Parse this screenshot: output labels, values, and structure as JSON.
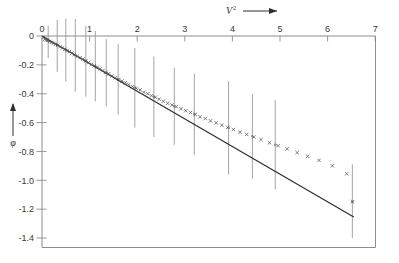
{
  "chart_data": {
    "type": "scatter",
    "title": "",
    "subtitle": "",
    "xlabel": "V²",
    "xlabel_base": "V",
    "xlabel_exponent": "2",
    "ylabel": "φ",
    "xlim": [
      0,
      7
    ],
    "ylim": [
      -1.4,
      0
    ],
    "grid": false,
    "legend": "none",
    "x_ticks": [
      "0",
      "1",
      "2",
      "3",
      "4",
      "5",
      "6",
      "7"
    ],
    "x_tick_values": [
      0,
      1,
      2,
      3,
      4,
      5,
      6,
      7
    ],
    "y_ticks": [
      "0",
      "-0.2",
      "-0.4",
      "-0.6",
      "-0.8",
      "-1.0",
      "-1.2",
      "-1.4"
    ],
    "y_tick_values": [
      0,
      -0.2,
      -0.4,
      -0.6,
      -0.8,
      -1.0,
      -1.2,
      -1.4
    ],
    "origin_label": "0",
    "x_axis_arrow": true,
    "y_axis_arrow": true,
    "marker": "x",
    "marker_color": "#555555",
    "fit_line_color": "#2b2b2b",
    "errorbar_color": "#9a9a9a",
    "frame_color": "#8d8d8d",
    "series": [
      {
        "name": "fit-line",
        "type": "line",
        "x": [
          0.0,
          6.55
        ],
        "y": [
          0.0,
          -1.255
        ]
      },
      {
        "name": "data-points",
        "type": "scatter",
        "points": [
          [
            0.03,
            -0.012
          ],
          [
            0.06,
            -0.022
          ],
          [
            0.09,
            -0.028
          ],
          [
            0.12,
            -0.03
          ],
          [
            0.16,
            -0.038
          ],
          [
            0.2,
            -0.044
          ],
          [
            0.24,
            -0.05
          ],
          [
            0.28,
            -0.058
          ],
          [
            0.33,
            -0.064
          ],
          [
            0.38,
            -0.074
          ],
          [
            0.43,
            -0.082
          ],
          [
            0.48,
            -0.092
          ],
          [
            0.53,
            -0.1
          ],
          [
            0.58,
            -0.108
          ],
          [
            0.63,
            -0.118
          ],
          [
            0.68,
            -0.128
          ],
          [
            0.74,
            -0.14
          ],
          [
            0.8,
            -0.15
          ],
          [
            0.86,
            -0.16
          ],
          [
            0.92,
            -0.172
          ],
          [
            0.98,
            -0.184
          ],
          [
            1.04,
            -0.196
          ],
          [
            1.1,
            -0.206
          ],
          [
            1.16,
            -0.216
          ],
          [
            1.22,
            -0.228
          ],
          [
            1.28,
            -0.24
          ],
          [
            1.34,
            -0.252
          ],
          [
            1.4,
            -0.262
          ],
          [
            1.47,
            -0.276
          ],
          [
            1.54,
            -0.29
          ],
          [
            1.61,
            -0.3
          ],
          [
            1.68,
            -0.312
          ],
          [
            1.75,
            -0.324
          ],
          [
            1.82,
            -0.336
          ],
          [
            1.9,
            -0.35
          ],
          [
            1.98,
            -0.362
          ],
          [
            2.06,
            -0.374
          ],
          [
            2.14,
            -0.39
          ],
          [
            2.22,
            -0.4
          ],
          [
            2.3,
            -0.414
          ],
          [
            2.38,
            -0.424
          ],
          [
            2.46,
            -0.438
          ],
          [
            2.55,
            -0.452
          ],
          [
            2.64,
            -0.466
          ],
          [
            2.73,
            -0.478
          ],
          [
            2.82,
            -0.49
          ],
          [
            2.92,
            -0.504
          ],
          [
            3.02,
            -0.518
          ],
          [
            3.12,
            -0.53
          ],
          [
            3.22,
            -0.544
          ],
          [
            3.32,
            -0.56
          ],
          [
            3.43,
            -0.572
          ],
          [
            3.54,
            -0.588
          ],
          [
            3.66,
            -0.602
          ],
          [
            3.78,
            -0.618
          ],
          [
            3.9,
            -0.634
          ],
          [
            4.02,
            -0.648
          ],
          [
            4.16,
            -0.666
          ],
          [
            4.3,
            -0.682
          ],
          [
            4.45,
            -0.7
          ],
          [
            4.6,
            -0.718
          ],
          [
            4.78,
            -0.74
          ],
          [
            4.96,
            -0.76
          ],
          [
            5.15,
            -0.782
          ],
          [
            5.36,
            -0.808
          ],
          [
            5.58,
            -0.834
          ],
          [
            5.82,
            -0.862
          ],
          [
            6.1,
            -0.9
          ],
          [
            6.4,
            -0.955
          ],
          [
            6.52,
            -1.148
          ]
        ]
      }
    ],
    "error_bars": [
      {
        "x": 0.13,
        "y": -0.032,
        "low": -0.152,
        "high": 0.072
      },
      {
        "x": 0.32,
        "y": -0.062,
        "low": -0.248,
        "high": 0.112
      },
      {
        "x": 0.5,
        "y": -0.096,
        "low": -0.316,
        "high": 0.12
      },
      {
        "x": 0.7,
        "y": -0.132,
        "low": -0.386,
        "high": 0.118
      },
      {
        "x": 0.92,
        "y": -0.172,
        "low": -0.42,
        "high": 0.07
      },
      {
        "x": 1.12,
        "y": -0.21,
        "low": -0.452,
        "high": 0.036
      },
      {
        "x": 1.35,
        "y": -0.254,
        "low": -0.488,
        "high": -0.022
      },
      {
        "x": 1.6,
        "y": -0.3,
        "low": -0.546,
        "high": -0.056
      },
      {
        "x": 1.95,
        "y": -0.358,
        "low": -0.636,
        "high": -0.082
      },
      {
        "x": 2.35,
        "y": -0.42,
        "low": -0.7,
        "high": -0.142
      },
      {
        "x": 2.78,
        "y": -0.486,
        "low": -0.754,
        "high": -0.22
      },
      {
        "x": 3.2,
        "y": -0.542,
        "low": -0.824,
        "high": -0.262
      },
      {
        "x": 3.92,
        "y": -0.636,
        "low": -0.96,
        "high": -0.312
      },
      {
        "x": 4.42,
        "y": -0.696,
        "low": -0.99,
        "high": -0.402
      },
      {
        "x": 4.9,
        "y": -0.754,
        "low": -1.064,
        "high": -0.444
      },
      {
        "x": 6.52,
        "y": -1.148,
        "low": -1.4,
        "high": -0.89
      }
    ]
  }
}
